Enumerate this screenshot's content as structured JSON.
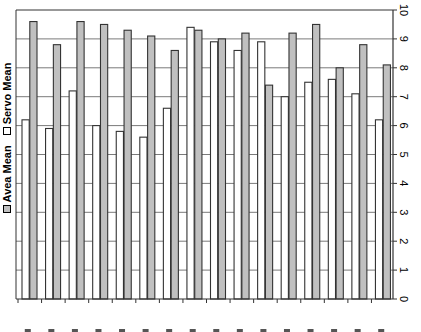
{
  "chart_data": {
    "type": "bar",
    "orientation": "vertical",
    "title": "",
    "xlabel": "",
    "ylabel": "",
    "categories": [
      "1",
      "2",
      "3",
      "4",
      "5",
      "6",
      "7",
      "8",
      "9",
      "10",
      "11",
      "12",
      "13",
      "14",
      "15",
      "16"
    ],
    "categories_note": "x-axis tick labels are cut off at bottom edge of screenshot; unreadable",
    "series": [
      {
        "name": "Servo Mean",
        "color": "#ffffff",
        "values": [
          6.2,
          5.9,
          7.2,
          6.0,
          5.8,
          5.6,
          6.6,
          9.4,
          8.9,
          8.6,
          8.9,
          7.0,
          7.5,
          7.6,
          7.1,
          6.2
        ]
      },
      {
        "name": "Avea Mean",
        "color": "#c0c0c0",
        "values": [
          9.6,
          8.8,
          9.6,
          9.5,
          9.3,
          9.1,
          8.6,
          9.3,
          9.0,
          9.2,
          7.4,
          9.2,
          9.5,
          8.0,
          8.8,
          8.1
        ]
      }
    ],
    "ylim": [
      0,
      10
    ],
    "yticks": [
      0,
      1,
      2,
      3,
      4,
      5,
      6,
      7,
      8,
      9,
      10
    ],
    "y_axis_position": "right",
    "ytick_label_rotation": -90,
    "grid": {
      "horizontal": true,
      "vertical": false
    },
    "legend": {
      "position": "left",
      "orientation": "vertical-rotated",
      "entries": [
        "Avea Mean",
        "Servo Mean"
      ]
    }
  },
  "legend": {
    "avea_label": "Avea Mean",
    "servo_label": "Servo Mean",
    "avea_color": "#c0c0c0",
    "servo_color": "#ffffff"
  }
}
